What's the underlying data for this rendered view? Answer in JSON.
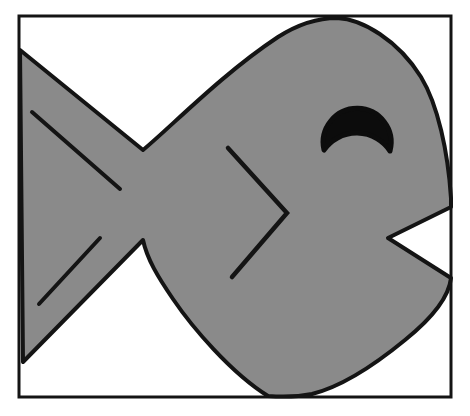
{
  "figure": {
    "canvas": {
      "width": "470",
      "height": "416",
      "viewbox": "0 0 470 416"
    },
    "colors": {
      "background": "#ffffff",
      "fish_fill": "#8a8a8a",
      "outline": "#141414",
      "eye_fill": "#0c0c0c",
      "frame_stroke": "#141414",
      "frame_fill": "#ffffff"
    },
    "frame": {
      "x": "19",
      "y": "16",
      "width": "432",
      "height": "381",
      "stroke_width": "3"
    },
    "fish": {
      "body_path": "M 143 150 C 172 126 222 74 278 37 C 300 23 320 18 337 18 C 362 19 398 40 421 77 C 438 105 448 152 451 198 L 451 207 L 388 238 L 451 278 C 449 297 431 319 405 340 C 377 363 344 386 312 394 C 297 397 281 397 268 396 C 231 373 192 327 173 299 C 158 277 147 259 143 240 L 23 362 L 20 50 Z",
      "body_stroke_width": "4",
      "eye_path": "M 324 150 A 34 34 0 1 1 390 151 A 40 40 0 0 0 324 150 Z",
      "eye_stroke_width": "5",
      "gill_path": "M 228 148 L 287 213 L 232 277",
      "gill_stroke_width": "4.5",
      "tail_line_paths": [
        "M 32 112 L 120 189",
        "M 100 238 L 39 304"
      ],
      "tail_stroke_width": "4"
    }
  }
}
